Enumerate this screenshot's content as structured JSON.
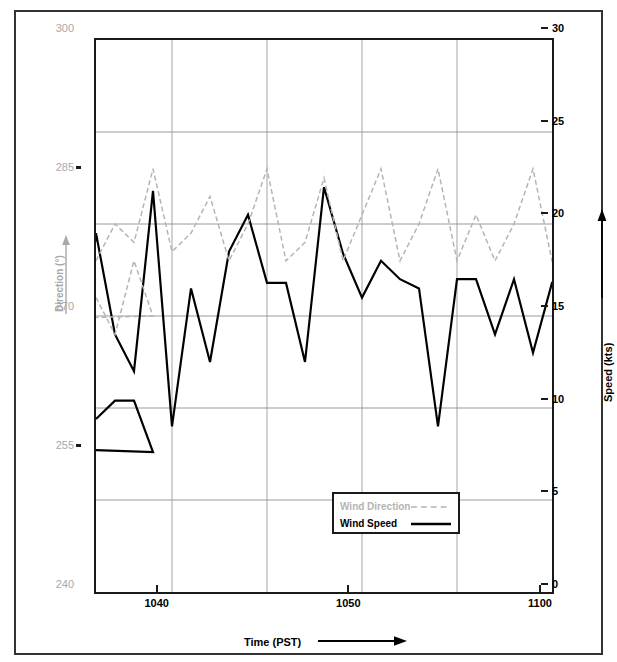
{
  "figure": {
    "left_axis": {
      "title": "Direction (°)",
      "ticks": [
        "300",
        "285",
        "270",
        "255",
        "240"
      ],
      "tick_values": [
        300,
        285,
        270,
        255,
        240
      ],
      "color": "#a8a8a8",
      "arrow": "up-arrow-icon"
    },
    "right_axis": {
      "title": "Speed (kts)",
      "ticks": [
        "30",
        "25",
        "20",
        "15",
        "10",
        "5",
        "0"
      ],
      "tick_values": [
        30,
        25,
        20,
        15,
        10,
        5,
        0
      ],
      "color": "#000000",
      "arrow": "up-arrow-icon"
    },
    "bottom_axis": {
      "title": "Time  (PST)",
      "ticks": [
        "1000",
        "1010",
        "1020",
        "1030",
        "1040",
        "1050",
        "1100"
      ],
      "tick_values": [
        1000,
        1010,
        1020,
        1030,
        1040,
        1050,
        1100
      ],
      "color": "#000000",
      "arrow": "right-arrow-icon"
    },
    "legend": {
      "items": [
        {
          "label": "Wind Direction",
          "color": "#b4b4b4",
          "style": "dashed"
        },
        {
          "label": "Wind Speed",
          "color": "#000000",
          "style": "solid"
        }
      ]
    }
  },
  "chart_data": {
    "type": "line",
    "title": "",
    "xlabel": "Time  (PST)",
    "ylabel": "Speed (kts)",
    "ylabel_secondary": "Direction (°)",
    "xlim": [
      996,
      1100
    ],
    "ylim": [
      0,
      30
    ],
    "ylim_secondary": [
      240,
      300
    ],
    "grid": true,
    "legend_position": "inside-lower-right",
    "xticks": [
      1000,
      1010,
      1020,
      1030,
      1040,
      1050,
      1100
    ],
    "yticks": [
      0,
      5,
      10,
      15,
      20,
      25,
      30
    ],
    "yticks_secondary": [
      240,
      255,
      270,
      285,
      300
    ],
    "x_minor_step": 5,
    "series": [
      {
        "name": "Wind Speed",
        "axis": "right",
        "units": "kts",
        "color": "#000000",
        "style": "solid",
        "x": [
          996,
          997,
          998,
          999,
          1000,
          1001,
          1002,
          1003,
          1004,
          1005,
          1006,
          1007,
          1008,
          1009,
          1010,
          1011,
          1012,
          1013,
          1014,
          1015,
          1016,
          1017,
          1018,
          1019,
          1020,
          1021,
          1022,
          1023,
          1024,
          1025,
          1026,
          1027,
          1028,
          1029,
          1030,
          1031,
          1032,
          1033,
          1034,
          1035,
          1036,
          1037,
          1038,
          1039,
          1040,
          1041,
          1042,
          1043,
          1044,
          1045,
          1046,
          1047,
          1048,
          1049,
          1050,
          1051,
          1052,
          1053,
          1054,
          1055,
          1056,
          1057,
          1058,
          1059,
          1060,
          1061,
          1062,
          1063,
          1064,
          1065,
          1066,
          1067,
          1068,
          1069,
          1070,
          1071,
          1072,
          1073,
          1074,
          1075,
          1076,
          1077,
          1078,
          1079,
          1080,
          1081,
          1082,
          1083,
          1084,
          1085,
          1086,
          1087,
          1088,
          1089,
          1090,
          1091,
          1092,
          1093,
          1094,
          1095,
          1096,
          1097,
          1098,
          1099,
          1100
        ],
        "values": [
          9.4,
          10.4,
          10.4,
          7.6,
          9.0,
          6.1,
          8.2,
          12.0,
          9.2,
          6.1,
          13.4,
          11.5,
          8.3,
          8.3,
          13.0,
          19.0,
          14.0,
          10.0,
          17.5,
          10.4,
          15.4,
          21.0,
          13.4,
          16.0,
          18.0,
          18.0,
          11.0,
          14.5,
          16.2,
          19.0,
          10.4,
          16.5,
          12.5,
          16.5,
          19.0,
          14.0,
          17.0,
          13.0,
          17.0,
          10.2,
          19.5,
          14.0,
          12.0,
          21.8,
          9.0,
          16.5,
          12.5,
          18.5,
          20.5,
          16.8,
          16.8,
          12.5,
          22.0,
          18.4,
          16.0,
          18.0,
          17.0,
          16.5,
          9.0,
          17.0,
          17.0,
          14.0,
          17.0,
          13.0,
          16.8,
          16.8,
          17.0,
          17.0,
          12.5,
          19.0,
          14.5,
          17.0,
          15.5,
          17.5,
          19.5,
          25.0,
          17.0,
          25.0,
          20.5,
          16.0,
          19.0,
          19.0,
          17.0,
          25.0,
          18.0,
          25.0,
          17.0,
          19.0,
          19.0,
          11.0,
          19.0,
          11.0,
          19.0,
          21.5,
          11.0,
          14.5,
          14.5,
          11.0,
          13.3,
          13.3,
          10.4,
          10.4,
          6.0,
          6.0,
          11.5
        ]
      },
      {
        "name": "Wind Direction",
        "axis": "left",
        "units": "degrees",
        "color": "#b4b4b4",
        "style": "dashed",
        "x": [
          996,
          997,
          998,
          999,
          1000,
          1001,
          1002,
          1003,
          1004,
          1005,
          1006,
          1007,
          1008,
          1009,
          1010,
          1011,
          1012,
          1013,
          1014,
          1015,
          1016,
          1017,
          1018,
          1019,
          1020,
          1021,
          1022,
          1023,
          1024,
          1025,
          1026,
          1027,
          1028,
          1029,
          1030,
          1031,
          1032,
          1033,
          1034,
          1035,
          1036,
          1037,
          1038,
          1039,
          1040,
          1041,
          1042,
          1043,
          1044,
          1045,
          1046,
          1047,
          1048,
          1049,
          1050,
          1051,
          1052,
          1053,
          1054,
          1055,
          1056,
          1057,
          1058,
          1059,
          1060,
          1061,
          1062,
          1063,
          1064,
          1065,
          1066,
          1067,
          1068,
          1069,
          1070,
          1071,
          1072,
          1073,
          1074,
          1075,
          1076,
          1077,
          1078,
          1079,
          1080,
          1081,
          1082,
          1083,
          1084,
          1085,
          1086,
          1087,
          1088,
          1089,
          1090,
          1091,
          1092,
          1093,
          1094,
          1095,
          1096,
          1097,
          1098,
          1099,
          1100
        ],
        "values": [
          272,
          268,
          276,
          270,
          268,
          278,
          296,
          276,
          300,
          272,
          282,
          276,
          300,
          278,
          276,
          282,
          276,
          278,
          282,
          276,
          280,
          278,
          284,
          276,
          278,
          282,
          277,
          276,
          283,
          278,
          280,
          276,
          281,
          288,
          276,
          278,
          288,
          276,
          277,
          285,
          276,
          280,
          278,
          286,
          277,
          279,
          283,
          276,
          280,
          286,
          276,
          278,
          285,
          276,
          281,
          286,
          276,
          280,
          286,
          276,
          281,
          276,
          280,
          286,
          276,
          278,
          280,
          276,
          282,
          276,
          278,
          286,
          276,
          280,
          278,
          276,
          283,
          276,
          286,
          276,
          278,
          282,
          276,
          278,
          285,
          276,
          280,
          277,
          280,
          276,
          272,
          276,
          266,
          270,
          262,
          268,
          258,
          266,
          262,
          271,
          276,
          272,
          266,
          252,
          258
        ]
      }
    ]
  }
}
